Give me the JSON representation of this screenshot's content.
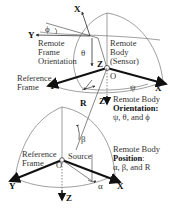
{
  "top": {
    "axes": {
      "x_tilted": "X",
      "y_left": "Y",
      "z_inner": "Z",
      "origin": "O",
      "y_ref": "Y",
      "x_ref": "X",
      "z_down": "Z"
    },
    "angles": {
      "phi": "ϕ",
      "theta": "θ",
      "psi": "ψ"
    },
    "remote_frame_label": [
      "Remote",
      "Frame",
      "Orientation"
    ],
    "remote_body_label": [
      "Remote",
      "Body",
      "(Sensor)"
    ],
    "reference_frame_label": [
      "Reference",
      "Frame"
    ],
    "r_label": "R",
    "orientation_caption": {
      "line1": "Remote Body",
      "line2": "Orientation:",
      "line3": "ψ, θ,  and ϕ"
    }
  },
  "bottom": {
    "axes": {
      "y": "Y",
      "x": "X",
      "z": "Z",
      "origin": "O"
    },
    "angles": {
      "beta": "β",
      "alpha": "α"
    },
    "reference_frame_label": [
      "Reference",
      "Frame"
    ],
    "source_label": "Source",
    "position_caption": {
      "line1": "Remote Body",
      "line2": "Position",
      "line2_suffix": ":",
      "line3": "α, β,  and R"
    }
  }
}
